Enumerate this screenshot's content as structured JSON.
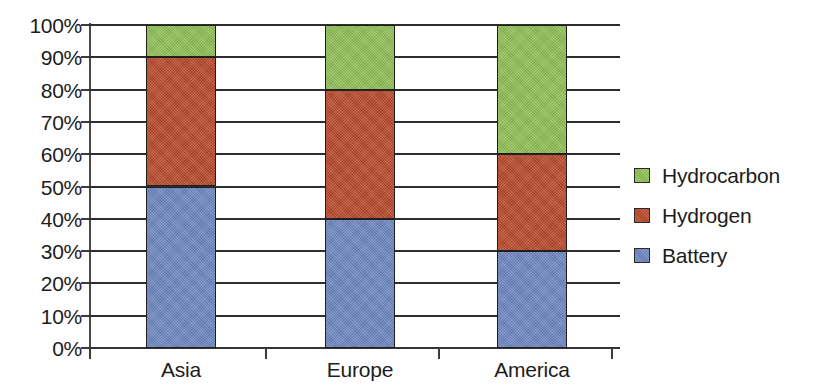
{
  "chart_data": {
    "type": "bar",
    "stacked": true,
    "stack_mode": "percent",
    "title": "",
    "xlabel": "",
    "ylabel": "",
    "categories": [
      "Asia",
      "Europe",
      "America"
    ],
    "series": [
      {
        "name": "Battery",
        "color": "#6E86C0",
        "values": [
          50,
          40,
          30
        ]
      },
      {
        "name": "Hydrogen",
        "color": "#B8492B",
        "values": [
          40,
          40,
          30
        ]
      },
      {
        "name": "Hydrocarbon",
        "color": "#8FBF55",
        "values": [
          10,
          20,
          40
        ]
      }
    ],
    "stack_boundaries": {
      "Asia": {
        "Battery": [
          0,
          50
        ],
        "Hydrogen": [
          50,
          90
        ],
        "Hydrocarbon": [
          90,
          100
        ]
      },
      "Europe": {
        "Battery": [
          0,
          40
        ],
        "Hydrogen": [
          40,
          80
        ],
        "Hydrocarbon": [
          80,
          100
        ]
      },
      "America": {
        "Battery": [
          0,
          30
        ],
        "Hydrogen": [
          30,
          60
        ],
        "Hydrocarbon": [
          60,
          100
        ]
      }
    },
    "ylim": [
      0,
      100
    ],
    "ytick_values": [
      0,
      10,
      20,
      30,
      40,
      50,
      60,
      70,
      80,
      90,
      100
    ],
    "ytick_labels": [
      "0%",
      "10%",
      "20%",
      "30%",
      "40%",
      "50%",
      "60%",
      "70%",
      "80%",
      "90%",
      "100%"
    ],
    "grid": true,
    "grid_axis": "y",
    "legend_position": "right",
    "legend_entries": [
      {
        "label": "Hydrocarbon",
        "color": "#8FBF55"
      },
      {
        "label": "Hydrogen",
        "color": "#B8492B"
      },
      {
        "label": "Battery",
        "color": "#6E86C0"
      }
    ]
  },
  "colors": {
    "hydrocarbon": "#8FBF55",
    "hydrogen": "#B8492B",
    "battery": "#6E86C0",
    "axis": "#3c3c3c",
    "grid": "#2e2e2e",
    "text": "#1c1c1c",
    "background": "#ffffff"
  }
}
